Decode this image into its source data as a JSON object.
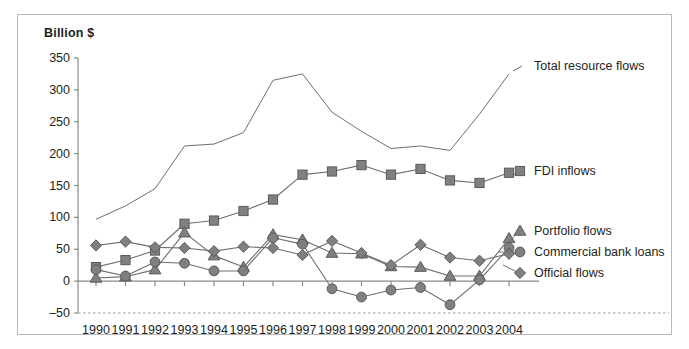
{
  "chart_data": {
    "type": "line",
    "title": "",
    "ylabel": "Billion $",
    "xlabel": "",
    "ylim": [
      -50,
      350
    ],
    "ytick_step": 50,
    "yticks": [
      "350",
      "300",
      "250",
      "200",
      "150",
      "100",
      "50",
      "0",
      "–50"
    ],
    "ytick_values": [
      350,
      300,
      250,
      200,
      150,
      100,
      50,
      0,
      -50
    ],
    "categories": [
      "1990",
      "1991",
      "1992",
      "1993",
      "1994",
      "1995",
      "1996",
      "1997",
      "1998",
      "1999",
      "2000",
      "2001",
      "2002",
      "2003",
      "2004"
    ],
    "grid": false,
    "legend_position": "right-inline",
    "series": [
      {
        "name": "Total resource flows",
        "marker": "none",
        "color": "#6e6e6e",
        "values": [
          97,
          118,
          145,
          212,
          215,
          233,
          315,
          325,
          265,
          235,
          208,
          212,
          205,
          262,
          325
        ]
      },
      {
        "name": "FDI inflows",
        "marker": "square",
        "color": "#808080",
        "values": [
          22,
          33,
          48,
          90,
          95,
          110,
          128,
          167,
          172,
          182,
          167,
          176,
          158,
          154,
          170
        ]
      },
      {
        "name": "Portfolio flows",
        "marker": "triangle",
        "color": "#808080",
        "values": [
          5,
          7,
          18,
          76,
          40,
          22,
          73,
          65,
          44,
          43,
          23,
          22,
          8,
          8,
          67
        ]
      },
      {
        "name": "Commercial bank loans",
        "marker": "circle",
        "color": "#808080",
        "values": [
          18,
          8,
          30,
          28,
          16,
          16,
          68,
          58,
          -12,
          -25,
          -14,
          -10,
          -37,
          2,
          52
        ]
      },
      {
        "name": "Official flows",
        "marker": "diamond",
        "color": "#808080",
        "values": [
          56,
          62,
          53,
          52,
          47,
          54,
          52,
          41,
          63,
          44,
          25,
          57,
          37,
          32,
          43
        ]
      }
    ],
    "annotations": [
      {
        "text": "Total resource flows",
        "series": "Total resource flows"
      },
      {
        "text": "FDI inflows",
        "series": "FDI inflows"
      },
      {
        "text": "Portfolio flows",
        "series": "Portfolio flows"
      },
      {
        "text": "Commercial bank loans",
        "series": "Commercial bank loans"
      },
      {
        "text": "Official flows",
        "series": "Official flows"
      }
    ],
    "colors": {
      "line": "#6e6e6e",
      "marker_fill": "#808080",
      "marker_stroke": "#5a5a5a",
      "axis": "#8a8a8a",
      "baseline_dashed": "#9a9a9a",
      "text": "#231f20",
      "frame": "#b9b9b9",
      "background": "#ffffff"
    }
  }
}
